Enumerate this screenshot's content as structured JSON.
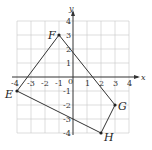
{
  "diagram": {
    "type": "coordinate-plane-quadrilateral",
    "axes": {
      "x_label": "x",
      "y_label": "y",
      "x_range": [
        -4,
        4
      ],
      "y_range": [
        -4,
        4
      ],
      "x_ticks": [
        "-4",
        "-3",
        "-2",
        "-1",
        "1",
        "2",
        "3",
        "4"
      ],
      "y_ticks": [
        "4",
        "3",
        "2",
        "1",
        "-1",
        "-2",
        "-3",
        "-4"
      ],
      "origin_label": "0"
    },
    "points": [
      {
        "label": "E",
        "x": -4,
        "y": -1
      },
      {
        "label": "F",
        "x": -1,
        "y": 3
      },
      {
        "label": "G",
        "x": 3,
        "y": -2
      },
      {
        "label": "H",
        "x": 2,
        "y": -4
      }
    ],
    "polygon_order": [
      "E",
      "F",
      "G",
      "H"
    ],
    "colors": {
      "stroke": "#333333",
      "grid": "#c8c8c8"
    }
  }
}
